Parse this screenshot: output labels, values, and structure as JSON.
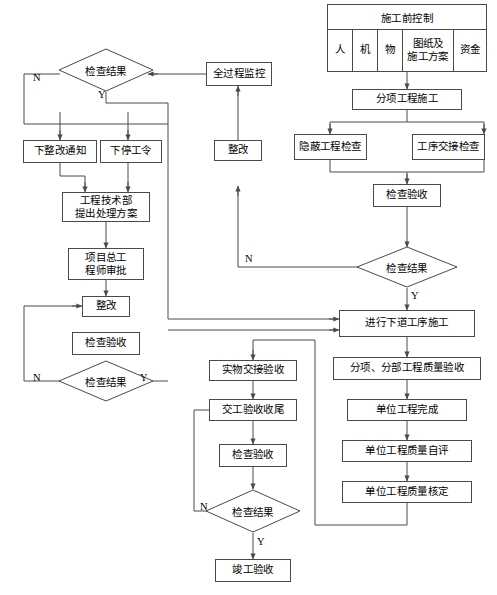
{
  "header_table": {
    "name": "施工前控制",
    "columns": [
      "人",
      "机",
      "物",
      "图纸及\n施工方案",
      "资金"
    ]
  },
  "nodes": {
    "fenxiang_shigong": "分项工程施工",
    "yinbi_jiancha": "隐蔽工程检查",
    "gongxu_jiaojie": "工序交接检查",
    "jiancha_yanshou_r": "检查验收",
    "jiancha_jieguo_r": "检查结果",
    "jinxing_xiadao": "进行下道工序施工",
    "fenxiang_fenbu": "分项、分部工程质量验收",
    "danwei_wancheng": "单位工程完成",
    "danwei_ziping": "单位工程质量自评",
    "danwei_heding": "单位工程质量核定",
    "quanguocheng": "全过程监控",
    "zhenggai_mid": "整改",
    "jiancha_jieguo_tl": "检查结果",
    "xia_zhenggai_tongzhi": "下整改通知",
    "xia_tinggong_ling": "下停工令",
    "gongcheng_jishubu": "工程技术部\n提出处理方案",
    "xiangmu_zonggong": "项目总工\n程师审批",
    "zhenggai_left": "整改",
    "jiancha_yanshou_l": "检查验收",
    "jiancha_jieguo_l": "检查结果",
    "shiwu_jiaojie": "实物交接验收",
    "jiaogong_shouwei": "交工验收收尾",
    "jiancha_yanshou_b": "检查验收",
    "jiancha_jieguo_b": "检查结果",
    "jungong_yanshou": "竣工验收"
  },
  "edge_labels": {
    "tl_n": "N",
    "tl_y": "Y",
    "left_n": "N",
    "left_y": "Y",
    "right_n": "N",
    "right_y": "Y",
    "bottom_n": "N",
    "bottom_y": "Y"
  },
  "colors": {
    "line": "#4a4a4a",
    "text": "#000000",
    "background": "#ffffff"
  }
}
